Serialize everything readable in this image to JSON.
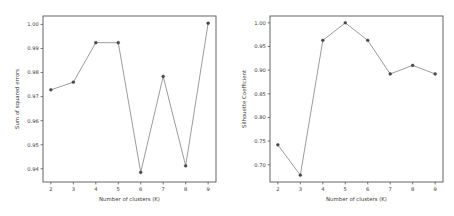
{
  "figure": {
    "background_color": "#ffffff",
    "line_color": "#8a8a8a",
    "marker_color": "#4a4a4a",
    "axis_color": "#555555",
    "text_color": "#3d3d3d"
  },
  "chart_data": [
    {
      "type": "line",
      "title": "",
      "panel": "left",
      "xlabel": "Number of clusters (K)",
      "ylabel": "Sum of squared errors",
      "x": [
        2,
        3,
        4,
        5,
        6,
        7,
        8,
        9
      ],
      "values": [
        0.9728,
        0.976,
        0.9924,
        0.9924,
        0.9385,
        0.9784,
        0.9412,
        1.0005
      ],
      "xticklabels": [
        "2",
        "3",
        "4",
        "5",
        "6",
        "7",
        "8",
        "9"
      ],
      "yticks": [
        0.94,
        0.95,
        0.96,
        0.97,
        0.98,
        0.99,
        1.0
      ],
      "yticklabels": [
        "0.94",
        "0.95",
        "0.96",
        "0.97",
        "0.98",
        "0.99",
        "1.00"
      ],
      "xlim": [
        1.65,
        9.35
      ],
      "ylim": [
        0.9345,
        1.0035
      ],
      "grid": false,
      "legend": null,
      "marker": "dot"
    },
    {
      "type": "line",
      "title": "",
      "panel": "right",
      "xlabel": "Number of clusters (K)",
      "ylabel": "Silhouette Coefficient",
      "x": [
        2,
        3,
        4,
        5,
        6,
        7,
        8,
        9
      ],
      "values": [
        0.742,
        0.678,
        0.963,
        1.0,
        0.963,
        0.892,
        0.91,
        0.892
      ],
      "xticklabels": [
        "2",
        "3",
        "4",
        "5",
        "6",
        "7",
        "8",
        "9"
      ],
      "yticks": [
        0.7,
        0.75,
        0.8,
        0.85,
        0.9,
        0.95,
        1.0
      ],
      "yticklabels": [
        "0.70",
        "0.75",
        "0.80",
        "0.85",
        "0.90",
        "0.95",
        "1.00"
      ],
      "xlim": [
        1.65,
        9.35
      ],
      "ylim": [
        0.6635,
        1.0145
      ],
      "grid": false,
      "legend": null,
      "marker": "dot"
    }
  ]
}
